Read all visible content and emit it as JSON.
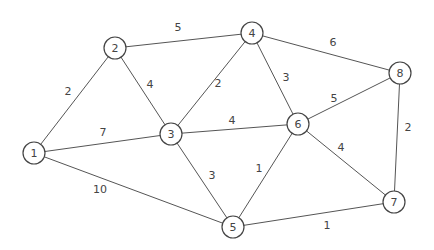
{
  "graph": {
    "type": "weighted-undirected-graph",
    "node_radius": 11,
    "nodes": [
      {
        "id": "1",
        "label": "1",
        "x": 34,
        "y": 153
      },
      {
        "id": "2",
        "label": "2",
        "x": 115,
        "y": 48
      },
      {
        "id": "3",
        "label": "3",
        "x": 171,
        "y": 134
      },
      {
        "id": "4",
        "label": "4",
        "x": 252,
        "y": 33
      },
      {
        "id": "5",
        "label": "5",
        "x": 233,
        "y": 227
      },
      {
        "id": "6",
        "label": "6",
        "x": 298,
        "y": 124
      },
      {
        "id": "7",
        "label": "7",
        "x": 394,
        "y": 202
      },
      {
        "id": "8",
        "label": "8",
        "x": 400,
        "y": 73
      }
    ],
    "edges": [
      {
        "from": "1",
        "to": "2",
        "weight": "2",
        "lx": 68,
        "ly": 92
      },
      {
        "from": "1",
        "to": "3",
        "weight": "7",
        "lx": 103,
        "ly": 133
      },
      {
        "from": "1",
        "to": "5",
        "weight": "10",
        "lx": 100,
        "ly": 190
      },
      {
        "from": "2",
        "to": "4",
        "weight": "5",
        "lx": 178,
        "ly": 28
      },
      {
        "from": "2",
        "to": "3",
        "weight": "4",
        "lx": 150,
        "ly": 85
      },
      {
        "from": "3",
        "to": "4",
        "weight": "2",
        "lx": 218,
        "ly": 84
      },
      {
        "from": "3",
        "to": "6",
        "weight": "4",
        "lx": 232,
        "ly": 121
      },
      {
        "from": "3",
        "to": "5",
        "weight": "3",
        "lx": 212,
        "ly": 176
      },
      {
        "from": "4",
        "to": "6",
        "weight": "3",
        "lx": 286,
        "ly": 78
      },
      {
        "from": "4",
        "to": "8",
        "weight": "6",
        "lx": 333,
        "ly": 43
      },
      {
        "from": "6",
        "to": "8",
        "weight": "5",
        "lx": 334,
        "ly": 99
      },
      {
        "from": "6",
        "to": "5",
        "weight": "1",
        "lx": 259,
        "ly": 169
      },
      {
        "from": "6",
        "to": "7",
        "weight": "4",
        "lx": 341,
        "ly": 148
      },
      {
        "from": "8",
        "to": "7",
        "weight": "2",
        "lx": 408,
        "ly": 128
      },
      {
        "from": "5",
        "to": "7",
        "weight": "1",
        "lx": 327,
        "ly": 226
      }
    ]
  }
}
